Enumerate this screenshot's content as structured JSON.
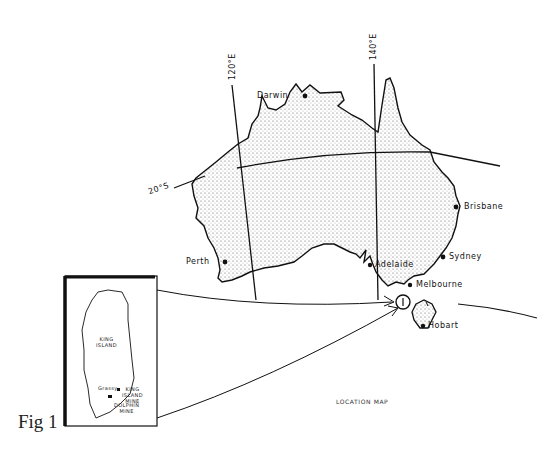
{
  "figure": {
    "label": "Fig 1",
    "caption": "LOCATION MAP"
  },
  "graticule": {
    "meridians": [
      "120°E",
      "140°E"
    ],
    "parallels": [
      "20°S"
    ]
  },
  "cities": [
    {
      "name": "Darwin"
    },
    {
      "name": "Brisbane"
    },
    {
      "name": "Perth"
    },
    {
      "name": "Adelaide"
    },
    {
      "name": "Sydney"
    },
    {
      "name": "Melbourne"
    },
    {
      "name": "Hobart"
    }
  ],
  "inset": {
    "title_line1": "KING",
    "title_line2": "ISLAND",
    "places": [
      {
        "name": "Grassy"
      },
      {
        "name_line1": "KING",
        "name_line2": "ISLAND",
        "name_line3": "MINE"
      },
      {
        "name_line1": "DOLPHIN",
        "name_line2": "MINE"
      }
    ],
    "marker_label": "I"
  },
  "colors": {
    "ink": "#111111",
    "stipple": "#555555",
    "paper": "#ffffff"
  }
}
